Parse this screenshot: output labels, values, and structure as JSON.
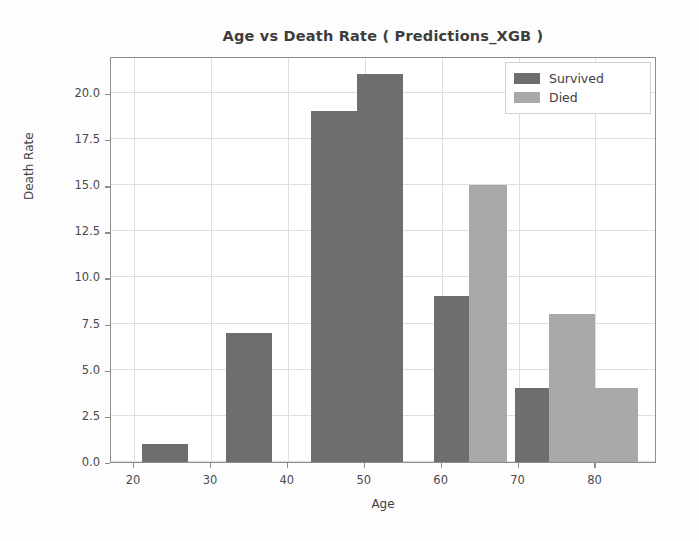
{
  "chart_data": {
    "type": "bar",
    "title": "Age vs Death Rate ( Predictions_XGB )",
    "xlabel": "Age",
    "ylabel": "Death Rate",
    "xlim": [
      17,
      88
    ],
    "ylim": [
      0,
      22
    ],
    "xticks": [
      20,
      30,
      40,
      50,
      60,
      70,
      80
    ],
    "yticks": [
      0.0,
      2.5,
      5.0,
      7.5,
      10.0,
      12.5,
      15.0,
      17.5,
      20.0
    ],
    "ytick_labels": [
      "0.0",
      "2.5",
      "5.0",
      "7.5",
      "10.0",
      "12.5",
      "15.0",
      "17.5",
      "20.0"
    ],
    "xtick_labels": [
      "20",
      "30",
      "40",
      "50",
      "60",
      "70",
      "80"
    ],
    "grid": true,
    "legend_position": "upper right",
    "colors": {
      "survived": "#6e6e6e",
      "died": "#a9a9a9",
      "grid": "#dddde3",
      "axis": "#8d8d8d",
      "text": "#3d3d3d",
      "background": "#ffffff"
    },
    "series": [
      {
        "name": "Survived",
        "color": "#6e6e6e",
        "bars": [
          {
            "x0": 21.0,
            "x1": 27.0,
            "value": 1
          },
          {
            "x0": 32.0,
            "x1": 38.0,
            "value": 7
          },
          {
            "x0": 43.0,
            "x1": 49.0,
            "value": 19
          },
          {
            "x0": 49.0,
            "x1": 55.0,
            "value": 21
          },
          {
            "x0": 59.0,
            "x1": 63.5,
            "value": 9
          },
          {
            "x0": 69.5,
            "x1": 74.0,
            "value": 4
          }
        ]
      },
      {
        "name": "Died",
        "color": "#a9a9a9",
        "bars": [
          {
            "x0": 32.0,
            "x1": 38.0,
            "value": 2
          },
          {
            "x0": 43.0,
            "x1": 49.0,
            "value": 10
          },
          {
            "x0": 49.0,
            "x1": 55.0,
            "value": 10
          },
          {
            "x0": 63.5,
            "x1": 68.5,
            "value": 15
          },
          {
            "x0": 74.0,
            "x1": 80.0,
            "value": 8
          },
          {
            "x0": 80.0,
            "x1": 85.5,
            "value": 4
          }
        ]
      }
    ],
    "legend": [
      {
        "label": "Survived",
        "color": "#6e6e6e"
      },
      {
        "label": "Died",
        "color": "#a9a9a9"
      }
    ]
  }
}
